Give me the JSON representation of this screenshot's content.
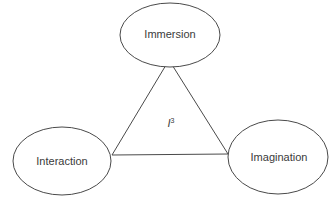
{
  "diagram": {
    "center": {
      "base": "I",
      "superscript": "3"
    },
    "nodes": [
      {
        "id": "immersion",
        "label": "Immersion"
      },
      {
        "id": "interaction",
        "label": "Interaction"
      },
      {
        "id": "imagination",
        "label": "Imagination"
      }
    ],
    "colors": {
      "stroke": "#4a4a4a",
      "text": "#3a3a3a",
      "background": "#ffffff"
    }
  }
}
